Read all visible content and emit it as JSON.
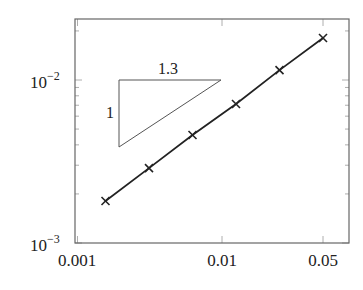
{
  "chart_data": {
    "type": "line",
    "title": "",
    "xlabel": "",
    "ylabel": "",
    "xscale": "log",
    "yscale": "log",
    "xlim": [
      0.001,
      0.06
    ],
    "ylim": [
      0.001,
      0.025
    ],
    "grid": false,
    "legend": null,
    "x_ticks": [
      {
        "value": 0.001,
        "label": "0.001"
      },
      {
        "value": 0.01,
        "label": "0.01"
      },
      {
        "value": 0.05,
        "label": "0.05"
      }
    ],
    "y_ticks": [
      {
        "value": 0.001,
        "base": "10",
        "exp": "−3"
      },
      {
        "value": 0.01,
        "base": "10",
        "exp": "−2"
      }
    ],
    "series": [
      {
        "name": "error",
        "marker": "x",
        "color": "#222222",
        "x": [
          0.0015625,
          0.003125,
          0.00625,
          0.0125,
          0.025,
          0.05
        ],
        "y": [
          0.00181,
          0.00288,
          0.0046,
          0.00713,
          0.0115,
          0.0181
        ]
      }
    ],
    "annotations": [
      {
        "type": "slope-triangle",
        "horizontal_label": "1.3",
        "vertical_label": "1"
      }
    ]
  }
}
